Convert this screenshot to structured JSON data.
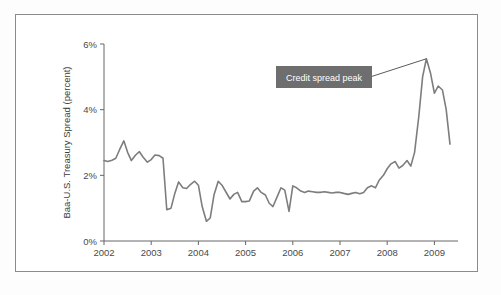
{
  "chart_data": {
    "type": "line",
    "title": "",
    "xlabel": "",
    "ylabel": "Baa-U.S. Treasury Spread (percent)",
    "xlim": [
      2002.0,
      2009.5
    ],
    "ylim": [
      0,
      6
    ],
    "grid": false,
    "legend": "none",
    "y_tick_labels": [
      "0%",
      "2%",
      "4%",
      "6%"
    ],
    "y_tick_values": [
      0,
      2,
      4,
      6
    ],
    "x_tick_labels": [
      "2002",
      "2003",
      "2004",
      "2005",
      "2006",
      "2007",
      "2008",
      "2009"
    ],
    "x_tick_values": [
      2002,
      2003,
      2004,
      2005,
      2006,
      2007,
      2008,
      2009
    ],
    "series": [
      {
        "name": "Baa-U.S. Treasury Spread",
        "color": "#7d7d7d",
        "x": [
          2002.0,
          2002.08,
          2002.17,
          2002.25,
          2002.33,
          2002.42,
          2002.5,
          2002.58,
          2002.67,
          2002.75,
          2002.83,
          2002.92,
          2003.0,
          2003.08,
          2003.17,
          2003.25,
          2003.33,
          2003.42,
          2003.5,
          2003.58,
          2003.67,
          2003.75,
          2003.83,
          2003.92,
          2004.0,
          2004.08,
          2004.17,
          2004.25,
          2004.33,
          2004.42,
          2004.5,
          2004.58,
          2004.67,
          2004.75,
          2004.83,
          2004.92,
          2005.0,
          2005.08,
          2005.17,
          2005.25,
          2005.33,
          2005.42,
          2005.5,
          2005.58,
          2005.67,
          2005.75,
          2005.83,
          2005.92,
          2006.0,
          2006.08,
          2006.17,
          2006.25,
          2006.33,
          2006.42,
          2006.5,
          2006.58,
          2006.67,
          2006.75,
          2006.83,
          2006.92,
          2007.0,
          2007.08,
          2007.17,
          2007.25,
          2007.33,
          2007.42,
          2007.5,
          2007.58,
          2007.67,
          2007.75,
          2007.83,
          2007.92,
          2008.0,
          2008.08,
          2008.17,
          2008.25,
          2008.33,
          2008.42,
          2008.5,
          2008.58,
          2008.67,
          2008.75,
          2008.83,
          2008.92,
          2009.0,
          2009.08,
          2009.17,
          2009.25,
          2009.33
        ],
        "values": [
          2.45,
          2.42,
          2.46,
          2.52,
          2.78,
          3.05,
          2.7,
          2.45,
          2.62,
          2.72,
          2.55,
          2.4,
          2.48,
          2.62,
          2.6,
          2.52,
          0.95,
          1.0,
          1.45,
          1.8,
          1.62,
          1.6,
          1.72,
          1.82,
          1.7,
          1.05,
          0.6,
          0.7,
          1.4,
          1.82,
          1.7,
          1.5,
          1.28,
          1.42,
          1.48,
          1.2,
          1.2,
          1.22,
          1.52,
          1.62,
          1.48,
          1.4,
          1.15,
          1.05,
          1.35,
          1.62,
          1.55,
          0.9,
          1.68,
          1.62,
          1.52,
          1.48,
          1.52,
          1.5,
          1.48,
          1.48,
          1.5,
          1.48,
          1.46,
          1.48,
          1.48,
          1.45,
          1.42,
          1.45,
          1.48,
          1.44,
          1.48,
          1.62,
          1.68,
          1.62,
          1.85,
          2.0,
          2.2,
          2.35,
          2.42,
          2.22,
          2.3,
          2.45,
          2.28,
          2.7,
          3.8,
          5.0,
          5.55,
          5.1,
          4.5,
          4.72,
          4.6,
          4.0,
          2.95
        ]
      }
    ],
    "annotations": [
      {
        "label": "Credit spread peak",
        "target_x": 2008.83,
        "target_y": 5.55,
        "box_color": "#6e6e6e",
        "text_color": "#ffffff"
      }
    ]
  },
  "figure": {
    "frame_color": "#8b8b8b",
    "background": "#ffffff"
  }
}
